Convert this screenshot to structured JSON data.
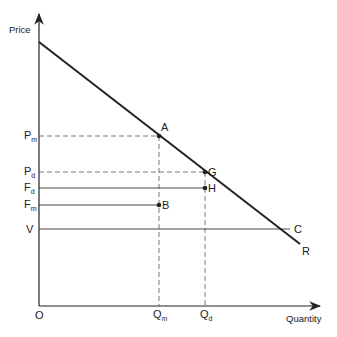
{
  "diagram": {
    "axes": {
      "y_label": "Price",
      "x_label": "Quantity",
      "origin_label": "O"
    },
    "curve": {
      "label": "R"
    },
    "horizontal_lines": [
      {
        "id": "pm",
        "base": "P",
        "sub": "m",
        "style": "dashed",
        "to_point": "A"
      },
      {
        "id": "pd",
        "base": "P",
        "sub": "d",
        "style": "dashed",
        "to_point": "G"
      },
      {
        "id": "fd",
        "base": "F",
        "sub": "d",
        "style": "solid",
        "to_point": "H"
      },
      {
        "id": "fm",
        "base": "F",
        "sub": "m",
        "style": "solid",
        "to_point": "B"
      },
      {
        "id": "v",
        "base": "V",
        "sub": "",
        "style": "solid",
        "end_label": "C"
      }
    ],
    "vertical_lines": [
      {
        "id": "qm",
        "base": "Q",
        "sub": "m",
        "style": "dashed"
      },
      {
        "id": "qd",
        "base": "Q",
        "sub": "d",
        "style": "dashed"
      }
    ],
    "points": [
      {
        "label": "A",
        "on": "curve"
      },
      {
        "label": "G",
        "on": "curve"
      },
      {
        "label": "H",
        "on": "Fd line"
      },
      {
        "label": "B",
        "on": "Fm line"
      }
    ],
    "colors": {
      "ink": "#222222",
      "background": "#ffffff"
    }
  }
}
